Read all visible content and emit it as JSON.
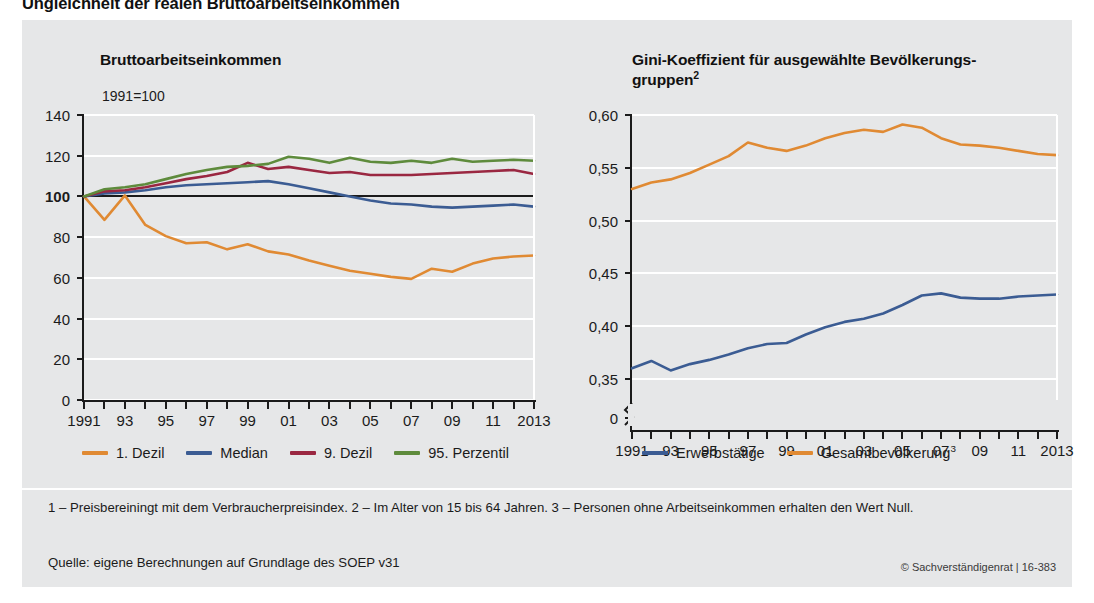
{
  "figure": {
    "title": "Ungleichheit der realen Bruttoarbeitseinkommen",
    "background_color": "#e6e7e8",
    "footnotes": "1 – Preisbereiningt mit dem Verbraucherpreisindex.  2 – Im Alter von 15 bis 64 Jahren.  3 – Personen ohne Arbeitseinkommen erhalten den Wert Null.",
    "source": "Quelle: eigene Berechnungen auf Grundlage des SOEP v31",
    "copyright": "© Sachverständigenrat | 16-383"
  },
  "colors": {
    "orange": "#E08A33",
    "blue": "#3B5C93",
    "maroon": "#9A2741",
    "green": "#5E8B3C",
    "grid": "#ffffff",
    "axis": "#1b1b1b"
  },
  "chart_data": [
    {
      "id": "left",
      "type": "line",
      "title": "Bruttoarbeitseinkommen",
      "unit_label": "1991=100",
      "xlabel": "",
      "ylabel": "",
      "grid": true,
      "legend_position": "bottom",
      "xlim": [
        1991,
        2013
      ],
      "ylim": [
        0,
        140
      ],
      "yticks": [
        0,
        20,
        40,
        60,
        80,
        100,
        120,
        140
      ],
      "ytick_labels": [
        "0",
        "20",
        "40",
        "60",
        "80",
        "100",
        "120",
        "140"
      ],
      "ytick_bold": "100",
      "x": [
        1991,
        1992,
        1993,
        1994,
        1995,
        1996,
        1997,
        1998,
        1999,
        2000,
        2001,
        2002,
        2003,
        2004,
        2005,
        2006,
        2007,
        2008,
        2009,
        2010,
        2011,
        2012,
        2013
      ],
      "xtick_labels": [
        "1991",
        "",
        "93",
        "",
        "95",
        "",
        "97",
        "",
        "99",
        "",
        "01",
        "",
        "03",
        "",
        "05",
        "",
        "07",
        "",
        "09",
        "",
        "11",
        "",
        "2013"
      ],
      "series": [
        {
          "name": "1. Dezil",
          "color": "#E08A33",
          "values": [
            100.0,
            88.5,
            100.5,
            86.0,
            80.5,
            77.0,
            77.5,
            74.0,
            76.5,
            73.0,
            71.5,
            68.5,
            66.0,
            63.5,
            62.0,
            60.5,
            59.5,
            64.5,
            63.0,
            67.0,
            69.5,
            70.5,
            71.0
          ]
        },
        {
          "name": "Median",
          "color": "#3B5C93",
          "values": [
            100.0,
            101.5,
            102.0,
            103.0,
            104.5,
            105.5,
            106.0,
            106.5,
            107.0,
            107.5,
            106.0,
            104.0,
            102.0,
            100.0,
            98.0,
            96.5,
            96.0,
            95.0,
            94.5,
            95.0,
            95.5,
            96.0,
            95.0
          ]
        },
        {
          "name": "9. Dezil",
          "color": "#9A2741",
          "values": [
            100.0,
            102.5,
            103.0,
            104.5,
            106.5,
            108.5,
            110.0,
            112.0,
            116.5,
            113.5,
            114.5,
            113.0,
            111.5,
            112.0,
            110.5,
            110.5,
            110.5,
            111.0,
            111.5,
            112.0,
            112.5,
            113.0,
            111.0
          ]
        },
        {
          "name": "95. Perzentil",
          "color": "#5E8B3C",
          "values": [
            100.0,
            103.5,
            104.5,
            106.0,
            108.5,
            111.0,
            113.0,
            114.5,
            115.0,
            116.0,
            119.5,
            118.5,
            116.5,
            119.0,
            117.0,
            116.5,
            117.5,
            116.5,
            118.5,
            117.0,
            117.5,
            118.0,
            117.5
          ]
        }
      ]
    },
    {
      "id": "right",
      "type": "line",
      "title": "Gini-Koeffizient für ausgewählte Bevölkerungs-gruppen",
      "title_superscript": "2",
      "unit_label": "",
      "grid": true,
      "legend_position": "bottom",
      "xlim": [
        1991,
        2013
      ],
      "ylim": [
        0.33,
        0.6
      ],
      "axis_break": true,
      "yticks": [
        0.0,
        0.35,
        0.4,
        0.45,
        0.5,
        0.55,
        0.6
      ],
      "ytick_labels": [
        "0",
        "0,35",
        "0,40",
        "0,45",
        "0,50",
        "0,55",
        "0,60"
      ],
      "x": [
        1991,
        1992,
        1993,
        1994,
        1995,
        1996,
        1997,
        1998,
        1999,
        2000,
        2001,
        2002,
        2003,
        2004,
        2005,
        2006,
        2007,
        2008,
        2009,
        2010,
        2011,
        2012,
        2013
      ],
      "xtick_labels": [
        "1991",
        "",
        "93",
        "",
        "95",
        "",
        "97",
        "",
        "99",
        "",
        "01",
        "",
        "03",
        "",
        "05",
        "",
        "07",
        "",
        "09",
        "",
        "11",
        "",
        "2013"
      ],
      "series": [
        {
          "name": "Erwerbstätige",
          "color": "#3B5C93",
          "values": [
            0.36,
            0.367,
            0.358,
            0.364,
            0.368,
            0.373,
            0.379,
            0.383,
            0.384,
            0.392,
            0.399,
            0.404,
            0.407,
            0.412,
            0.42,
            0.429,
            0.431,
            0.427,
            0.426,
            0.426,
            0.428,
            0.429,
            0.43
          ]
        },
        {
          "name": "Gesamtbevölkerung",
          "superscript": "3",
          "color": "#E08A33",
          "values": [
            0.53,
            0.536,
            0.539,
            0.545,
            0.553,
            0.561,
            0.574,
            0.569,
            0.566,
            0.571,
            0.578,
            0.583,
            0.586,
            0.584,
            0.591,
            0.588,
            0.578,
            0.572,
            0.571,
            0.569,
            0.566,
            0.563,
            0.562
          ]
        }
      ]
    }
  ]
}
